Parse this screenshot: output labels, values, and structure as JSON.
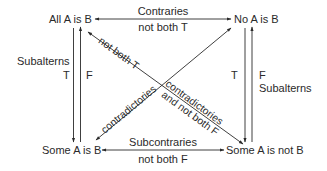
{
  "diagram": {
    "corners": {
      "top_left": "All A is B",
      "top_right": "No A is B",
      "bottom_left": "Some A is B",
      "bottom_right": "Some A is not B"
    },
    "relations": {
      "top": {
        "name": "Contraries",
        "rule": "not both T"
      },
      "bottom": {
        "name": "Subcontraries",
        "rule": "not both F"
      },
      "left": {
        "name": "Subalterns",
        "down_label": "T",
        "up_label": "F"
      },
      "right": {
        "name": "Subalterns",
        "down_label": "T",
        "up_label": "F"
      },
      "diagonal_a_upper": "not both T",
      "diagonal_a_lower_line1": "contradictories",
      "diagonal_a_lower_line2": "and not both F",
      "diagonal_b": "contradictories"
    },
    "colors": {
      "line": "#2a2a2a",
      "text": "#2a2a2a",
      "background": "#ffffff"
    }
  }
}
